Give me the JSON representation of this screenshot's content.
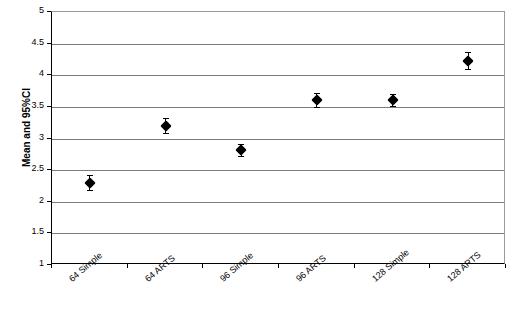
{
  "chart_data": {
    "type": "scatter",
    "title": "",
    "subtitle": "",
    "xlabel": "",
    "ylabel": "Mean and 95%CI",
    "ylim": [
      1,
      5
    ],
    "ytick_labels": [
      "5",
      "4.5",
      "4",
      "3.5",
      "3",
      "2.5",
      "2",
      "1.5",
      "1"
    ],
    "ytick_values": [
      5,
      4.5,
      4,
      3.5,
      3,
      2.5,
      2,
      1.5,
      1
    ],
    "grid": true,
    "legend": "none",
    "categories": [
      "64 Simple",
      "64 ARTS",
      "96 Simple",
      "96 ARTS",
      "128 Simple",
      "128 ARTS"
    ],
    "series": [
      {
        "name": "Mean and 95%CI",
        "marker": "filled-diamond",
        "color": "#000000",
        "values": [
          2.3,
          3.2,
          2.82,
          3.61,
          3.61,
          4.23
        ],
        "ci_low": [
          2.18,
          3.08,
          2.72,
          3.5,
          3.52,
          4.1
        ],
        "ci_high": [
          2.42,
          3.32,
          2.92,
          3.72,
          3.7,
          4.36
        ]
      }
    ],
    "points": [
      {
        "category": "64 Simple",
        "mean": 2.3,
        "ci_low": 2.18,
        "ci_high": 2.42
      },
      {
        "category": "64 ARTS",
        "mean": 3.2,
        "ci_low": 3.08,
        "ci_high": 3.32
      },
      {
        "category": "96 Simple",
        "mean": 2.82,
        "ci_low": 2.72,
        "ci_high": 2.92
      },
      {
        "category": "96 ARTS",
        "mean": 3.61,
        "ci_low": 3.5,
        "ci_high": 3.72
      },
      {
        "category": "128 Simple",
        "mean": 3.61,
        "ci_low": 3.52,
        "ci_high": 3.7
      },
      {
        "category": "128 ARTS",
        "mean": 4.23,
        "ci_low": 4.1,
        "ci_high": 4.36
      }
    ],
    "colors": {
      "marker": "#000000",
      "gridline": "#7b7b7b",
      "axis": "#000000",
      "background": "#ffffff"
    }
  }
}
